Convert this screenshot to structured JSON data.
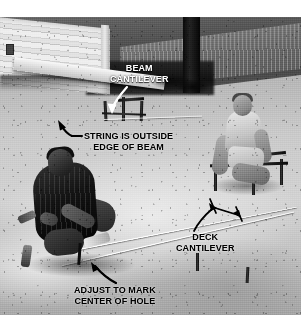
{
  "figure": {
    "kind": "annotated-photograph",
    "style": "black-and-white instructional photo",
    "width": 301,
    "height": 315
  },
  "colors": {
    "label_light": "#ffffff",
    "label_dark": "#000000",
    "arrow": "#000000",
    "page_background": "#ffffff"
  },
  "callouts": [
    {
      "id": "beam-cantilever",
      "text": "BEAM\nCANTILEVER",
      "color": "light",
      "arrow": "curved-down-left"
    },
    {
      "id": "string-outside-edge",
      "text": "STRING IS OUTSIDE\nEDGE OF BEAM",
      "color": "dark",
      "arrow": "curved-up-left"
    },
    {
      "id": "deck-cantilever",
      "text": "DECK\nCANTILEVER",
      "color": "dark",
      "arrow": "dimension-double-headed"
    },
    {
      "id": "adjust-to-mark",
      "text": "ADJUST TO MARK\nCENTER OF HOLE",
      "color": "dark",
      "arrow": "curved-up-left"
    }
  ],
  "scene": {
    "elements": [
      "house-siding",
      "cantilevered-beam",
      "tree-trunk",
      "grassy-slope",
      "batter-boards",
      "layout-strings",
      "worker-foreground",
      "worker-background",
      "dirt-ground"
    ]
  }
}
